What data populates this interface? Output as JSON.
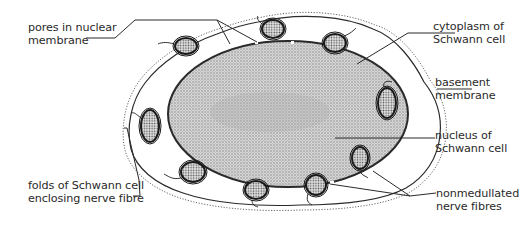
{
  "labels": {
    "pores": {
      "line1": "pores in nuclear",
      "line2": "membrane"
    },
    "cytoplasm": {
      "line1": "cytoplasm of",
      "line2": "Schwann  cell"
    },
    "basement": {
      "line1": "basement",
      "line2": "membrane"
    },
    "nucleus": {
      "line1": "nucleus of",
      "line2": "Schwann cell"
    },
    "folds": {
      "line1": "folds of Schwann cell",
      "line2": "enclosing nerve fibre"
    },
    "fibres": {
      "line1": "nonmedullated",
      "line2": "nerve fibres"
    }
  },
  "colors": {
    "ink": "#2a2a2a",
    "nucleus_fill": "#bdbdbd",
    "fibre_fill": "#9a9a9a",
    "background": "#ffffff"
  }
}
